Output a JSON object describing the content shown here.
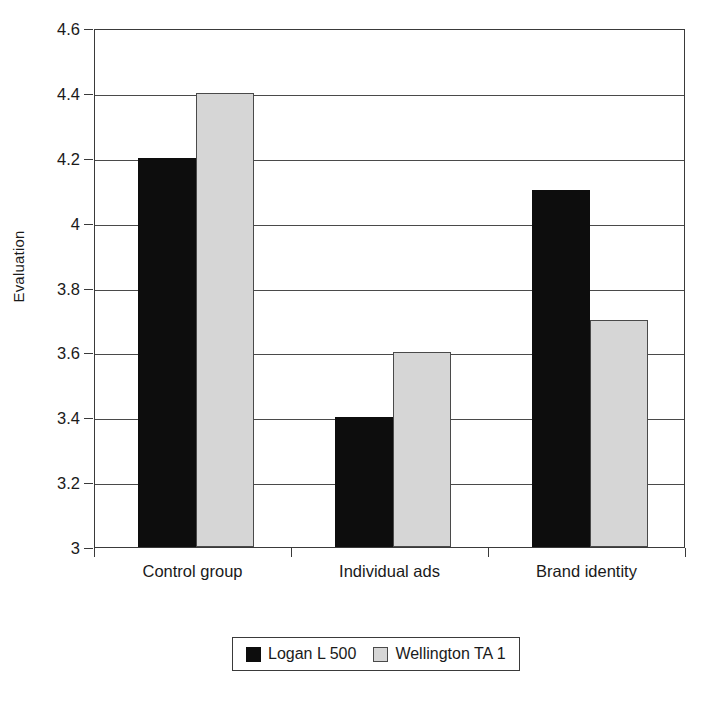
{
  "chart_data": {
    "type": "bar",
    "title": "",
    "subtitle": "",
    "xlabel": "",
    "ylabel": "Evaluation",
    "categories": [
      "Control group",
      "Individual ads",
      "Brand identity"
    ],
    "series": [
      {
        "name": "Logan L 500",
        "color": "#0d0d0d",
        "values": [
          4.2,
          3.4,
          4.1
        ]
      },
      {
        "name": "Wellington TA 1",
        "color": "#d6d6d6",
        "values": [
          4.4,
          3.6,
          3.7
        ]
      }
    ],
    "ylim": [
      3,
      4.6
    ],
    "ytick_step": 0.2,
    "yticks": [
      3,
      3.2,
      3.4,
      3.6,
      3.8,
      4,
      4.2,
      4.4,
      4.6
    ],
    "ytick_labels": [
      "3",
      "3.2",
      "3.4",
      "3.6",
      "3.8",
      "4",
      "4.2",
      "4.4",
      "4.6"
    ],
    "grid": true,
    "grid_axis": "y",
    "legend_position": "bottom",
    "bar_group_layout": "grouped",
    "plot_border": true
  },
  "legend": {
    "entries": [
      {
        "label": "Logan L 500",
        "swatch": "black-square-swatch"
      },
      {
        "label": "Wellington TA 1",
        "swatch": "gray-square-swatch"
      }
    ]
  }
}
